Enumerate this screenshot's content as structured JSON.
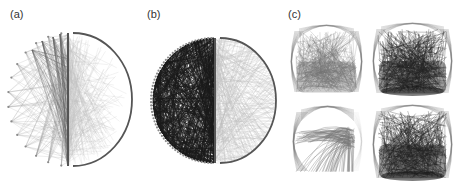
{
  "figure": {
    "panels": [
      {
        "id": "a",
        "label": "(a)",
        "x": 10,
        "y": 8
      },
      {
        "id": "b",
        "label": "(b)",
        "x": 147,
        "y": 8
      },
      {
        "id": "c",
        "label": "(c)",
        "x": 288,
        "y": 8
      }
    ],
    "colors": {
      "axis_line": "#555555",
      "sparse_edge": "#bdbdbd",
      "dense_edge": "#1a1a1a",
      "node": "#8a8a8a",
      "grid_edge_light": "#777777",
      "grid_edge_dark": "#222222"
    },
    "panel_a": {
      "divider_x": 68,
      "top": 33,
      "bottom": 166,
      "arc_radius_x": 59,
      "left_nodes": 14,
      "hub_count": 4
    },
    "panel_b": {
      "divider_x": 215,
      "top": 38,
      "bottom": 163,
      "arc_radius_x": 56,
      "left_nodes": 60
    },
    "panel_c": {
      "subplots": [
        {
          "name": "top-left",
          "x": 293,
          "y": 27,
          "w": 67,
          "h": 69,
          "tone": "medium"
        },
        {
          "name": "top-right",
          "x": 375,
          "y": 25,
          "w": 75,
          "h": 72,
          "tone": "dark"
        },
        {
          "name": "bottom-left",
          "x": 295,
          "y": 108,
          "w": 65,
          "h": 67,
          "tone": "sparse"
        },
        {
          "name": "bottom-right",
          "x": 375,
          "y": 107,
          "w": 75,
          "h": 75,
          "tone": "dark"
        }
      ]
    }
  }
}
